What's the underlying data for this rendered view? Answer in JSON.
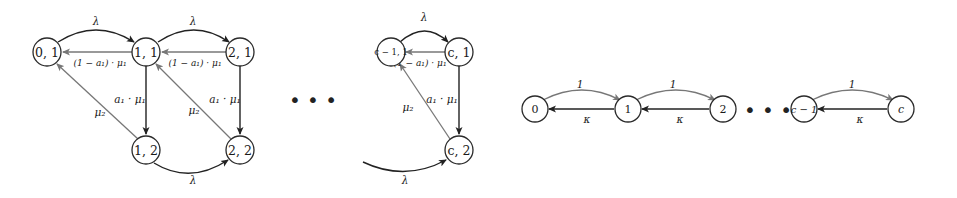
{
  "diagram_left": {
    "title": "Two-phase birth-death Markov chain",
    "nodes": [
      {
        "id": "n01",
        "label": "0, 1"
      },
      {
        "id": "n11",
        "label": "1, 1"
      },
      {
        "id": "n21",
        "label": "2, 1"
      },
      {
        "id": "n12",
        "label": "1, 2"
      },
      {
        "id": "n22",
        "label": "2, 2"
      },
      {
        "id": "ncm11",
        "label": "c − 1, 1"
      },
      {
        "id": "nc1",
        "label": "c, 1"
      },
      {
        "id": "nc2",
        "label": "c, 2"
      }
    ],
    "edges": {
      "lambda_01_11": "λ",
      "lambda_11_21": "λ",
      "lambda_cm1_c1": "λ",
      "lambda_12_22": "λ",
      "lambda_in_c2": "λ",
      "ret_11_01": "(1 − a₁) · μ₁",
      "ret_21_11": "(1 − a₁) · μ₁",
      "ret_c1_cm1": "(1 − a₁) · μ₁",
      "down_11_12": "a₁ · μ₁",
      "down_21_22": "a₁ · μ₁",
      "down_c1_c2": "a₁ · μ₁",
      "mu2_12_01": "μ₂",
      "mu2_22_11": "μ₂",
      "mu2_c2_cm1": "μ₂"
    },
    "ellipsis": "• • •"
  },
  "diagram_right": {
    "title": "Linear chain",
    "nodes": [
      {
        "id": "r0",
        "label": "0"
      },
      {
        "id": "r1",
        "label": "1"
      },
      {
        "id": "r2",
        "label": "2"
      },
      {
        "id": "rcm1",
        "label": "c − 1"
      },
      {
        "id": "rc",
        "label": "c"
      }
    ],
    "edges": {
      "up_0_1": "1",
      "up_1_2": "1",
      "up_cm1_c": "1",
      "down_1_0": "κ",
      "down_2_1": "κ",
      "down_c_cm1": "κ"
    },
    "ellipsis": "• • •"
  }
}
